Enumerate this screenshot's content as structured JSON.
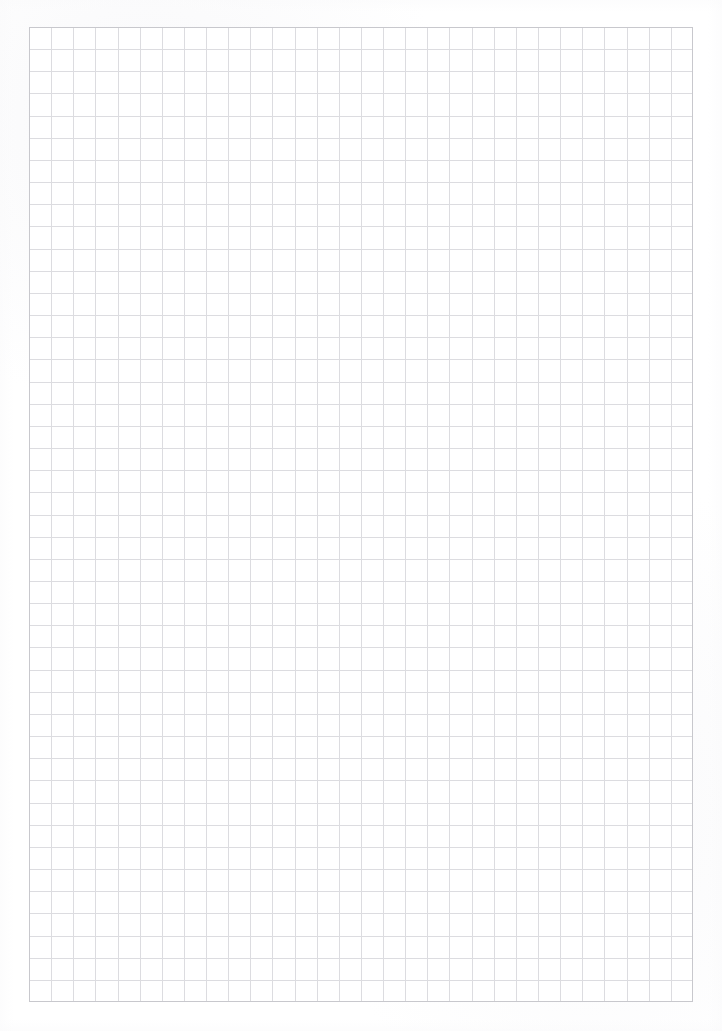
{
  "document": {
    "type": "grid-paper",
    "title": "Blank grid paper sheet",
    "description": "Scanned blank square-ruled (graph) paper. No text, headings, labels or marks are present on the page.",
    "page_background_color": "#ffffff",
    "has_text": false,
    "has_handwriting": false,
    "text_content": ""
  },
  "grid": {
    "left": 29,
    "top": 27,
    "width": 664,
    "height": 975,
    "columns": 30,
    "rows": 44,
    "cell_width": 22.13,
    "cell_height": 22.16,
    "line_color": "#dcdce0",
    "line_width": 1,
    "border_color": "#c8c8cd",
    "border_width": 1,
    "cell_fill_color": "#ffffff",
    "ruling_style": "square",
    "major_lines": false
  },
  "margins": {
    "left": 29,
    "right": 29,
    "top": 27,
    "bottom": 29,
    "color": "#ffffff"
  },
  "canvas": {
    "width": 722,
    "height": 1031
  }
}
